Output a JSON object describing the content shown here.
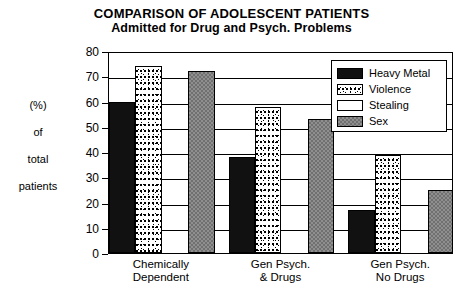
{
  "chart_data": {
    "type": "bar",
    "title": "COMPARISON OF ADOLESCENT PATIENTS",
    "subtitle": "Admitted for Drug and Psych. Problems",
    "xlabel": "",
    "ylabel": "(%) of total patients",
    "ylabel_lines": [
      "(%)",
      "of",
      "total",
      "patients"
    ],
    "ylim": [
      0,
      80
    ],
    "ytick_labels": [
      "80",
      "70",
      "60",
      "50",
      "40",
      "30",
      "20",
      "10",
      "0"
    ],
    "ytick_values": [
      80,
      70,
      60,
      50,
      40,
      30,
      20,
      10,
      0
    ],
    "grid": true,
    "legend_position": "top-right",
    "categories": [
      "Chemically Dependent",
      "Gen Psych. & Drugs",
      "Gen Psych. No Drugs"
    ],
    "category_lines": [
      [
        "Chemically",
        "Dependent"
      ],
      [
        "Gen Psych.",
        "& Drugs"
      ],
      [
        "Gen Psych.",
        "No Drugs"
      ]
    ],
    "series": [
      {
        "name": "Heavy Metal",
        "fill": "solid-black",
        "color": "#111111",
        "values": [
          60,
          38,
          17
        ]
      },
      {
        "name": "Violence",
        "fill": "speckled-dots",
        "color": "#ffffff",
        "values": [
          74,
          58,
          39
        ]
      },
      {
        "name": "Stealing",
        "fill": "white",
        "color": "#ffffff",
        "values": [
          0,
          0,
          0
        ]
      },
      {
        "name": "Sex",
        "fill": "gray-hatch",
        "color": "#8f8f8f",
        "values": [
          72,
          53,
          25
        ]
      }
    ]
  },
  "legend": {
    "items": [
      {
        "label": "Heavy Metal"
      },
      {
        "label": "Violence"
      },
      {
        "label": "Stealing"
      },
      {
        "label": "Sex"
      }
    ]
  }
}
